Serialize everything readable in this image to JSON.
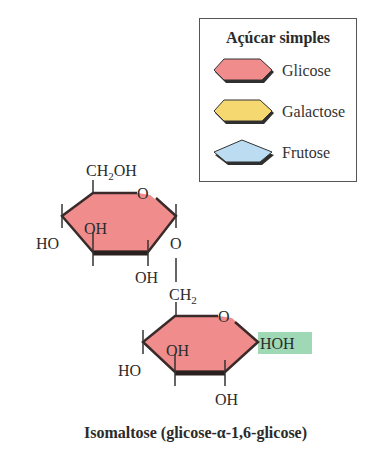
{
  "legend": {
    "title": "Açúcar simples",
    "items": [
      {
        "label": "Glicose",
        "shape": "hexagon",
        "color": "#f08c8c"
      },
      {
        "label": "Galactose",
        "shape": "hexagon",
        "color": "#f6d870"
      },
      {
        "label": "Frutose",
        "shape": "pentagon",
        "color": "#bcdcf2"
      }
    ]
  },
  "molecule": {
    "ring_color": "#f08c8c",
    "highlight_color": "#9fd8b4",
    "top_ring": {
      "ch2oh": "CH",
      "ch2oh_sub": "2",
      "ch2oh_tail": "OH",
      "ring_o": "O",
      "oh_inside": "OH",
      "ho_left": "HO",
      "oh_bottom": "OH",
      "link_o": "O"
    },
    "link": {
      "ch2": "CH",
      "ch2_sub": "2"
    },
    "bottom_ring": {
      "ring_o": "O",
      "oh_inside": "OH",
      "ho_left": "HO",
      "oh_bottom": "OH",
      "hoh": "HOH"
    }
  },
  "caption": "Isomaltose (glicose-α-1,6-glicose)"
}
